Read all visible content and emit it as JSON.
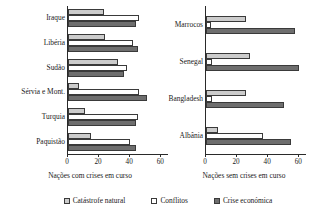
{
  "chart_data": {
    "type": "bar",
    "orientation": "horizontal",
    "title": "",
    "grid": false,
    "legend_position": "bottom",
    "legend": [
      "Catástrofe natural",
      "Conflitos",
      "Crise económica"
    ],
    "series_colors": [
      "#cccccc",
      "#ffffff",
      "#6e6e6e"
    ],
    "xlim": [
      0,
      65
    ],
    "xticks": [
      0,
      20,
      40,
      60
    ],
    "xtick_labels": [
      "0",
      "20",
      "40",
      "60"
    ],
    "panels": [
      {
        "xlabel": "Nações com crises em curso",
        "categories": [
          "Iraque",
          "Libéria",
          "Sudão",
          "Sérvia e Mont.",
          "Turquia",
          "Paquistão"
        ],
        "series": [
          {
            "name": "Catástrofe natural",
            "values": [
              23,
              24,
              32,
              7,
              11,
              15
            ]
          },
          {
            "name": "Conflitos",
            "values": [
              46,
              42,
              38,
              46,
              45,
              40
            ]
          },
          {
            "name": "Crise económica",
            "values": [
              44,
              45,
              36,
              51,
              44,
              44
            ]
          }
        ]
      },
      {
        "xlabel": "Nações sem crises em curso",
        "categories": [
          "Marrocos",
          "Senegal",
          "Bangladesh",
          "Albânia"
        ],
        "series": [
          {
            "name": "Catástrofe natural",
            "values": [
              26,
              28,
              26,
              8
            ]
          },
          {
            "name": "Conflitos",
            "values": [
              3,
              4,
              4,
              37
            ]
          },
          {
            "name": "Crise económica",
            "values": [
              57,
              60,
              50,
              55
            ]
          }
        ]
      }
    ]
  }
}
